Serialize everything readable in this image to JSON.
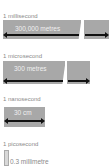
{
  "diagram": {
    "rows": [
      {
        "time_label": "1 millisecond",
        "distance_label": "300,000 metres",
        "broken": true
      },
      {
        "time_label": "1 microsecond",
        "distance_label": "300 metres",
        "broken": true
      },
      {
        "time_label": "1 nanosecond",
        "distance_label": "30 cm",
        "broken": false
      },
      {
        "time_label": "1 picosecond",
        "distance_label": "0.3 millimetre",
        "broken": false
      }
    ],
    "colors": {
      "bar": "#a8a8a8",
      "arrow": "#111111",
      "label": "#8a8a8a",
      "bar_text": "#f0f0f0"
    }
  }
}
